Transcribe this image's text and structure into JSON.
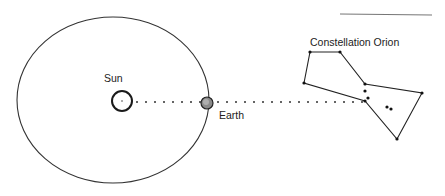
{
  "diagram": {
    "labels": {
      "sun": "Sun",
      "earth": "Earth",
      "constellation": "Constellation Orion"
    },
    "colors": {
      "ink": "#222222",
      "earth_fill": "#8a8a8a",
      "background": "#ffffff"
    },
    "orbit": {
      "cx": 113,
      "cy": 100,
      "rx": 96,
      "ry": 83
    },
    "sun": {
      "cx": 122,
      "cy": 101,
      "r": 10
    },
    "earth": {
      "cx": 207,
      "cy": 103,
      "r": 6
    },
    "sightline": {
      "x1": 136,
      "y1": 102,
      "x2": 366,
      "y2": 102
    },
    "orion": {
      "vertices": [
        [
          310,
          52
        ],
        [
          340,
          52
        ],
        [
          365,
          84
        ],
        [
          422,
          93
        ],
        [
          397,
          139
        ],
        [
          365,
          101
        ],
        [
          304,
          83
        ]
      ],
      "extra_stars": [
        [
          365,
          91
        ],
        [
          368,
          98
        ],
        [
          387,
          107
        ],
        [
          391,
          109
        ]
      ]
    }
  }
}
